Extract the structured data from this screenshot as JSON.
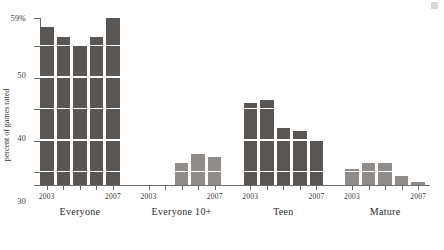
{
  "chart_data": {
    "type": "bar",
    "title": "",
    "xlabel": "",
    "ylabel": "percent of games rated",
    "ylim": [
      6,
      59
    ],
    "grid": true,
    "legend": false,
    "y_ticks": [
      {
        "value": 59,
        "label": "59%"
      },
      {
        "value": 50,
        "label": "50"
      },
      {
        "value": 40,
        "label": "40"
      },
      {
        "value": 30,
        "label": "30"
      },
      {
        "value": 20,
        "label": "20"
      },
      {
        "value": 10,
        "label": "10"
      },
      {
        "value": 6,
        "label": "6"
      }
    ],
    "gridlines": [
      50,
      40,
      30,
      20,
      10
    ],
    "x": [
      "2003",
      "2004",
      "2005",
      "2006",
      "2007"
    ],
    "year_tick_labels": [
      "2003",
      "",
      "",
      "",
      "2007"
    ],
    "groups": [
      {
        "name": "Everyone",
        "label": "Everyone",
        "color": "#595654",
        "values": [
          56,
          53,
          50,
          53,
          59
        ]
      },
      {
        "name": "Everyone 10+",
        "label": "Everyone 10+",
        "color": "#8f8c89",
        "values": [
          null,
          null,
          13,
          16,
          15
        ]
      },
      {
        "name": "Teen",
        "label": "Teen",
        "color": "#595654",
        "values": [
          32,
          33,
          24,
          23,
          20
        ]
      },
      {
        "name": "Mature",
        "label": "Mature",
        "color": "#8f8c89",
        "values": [
          11,
          13,
          13,
          9,
          7
        ]
      }
    ]
  }
}
